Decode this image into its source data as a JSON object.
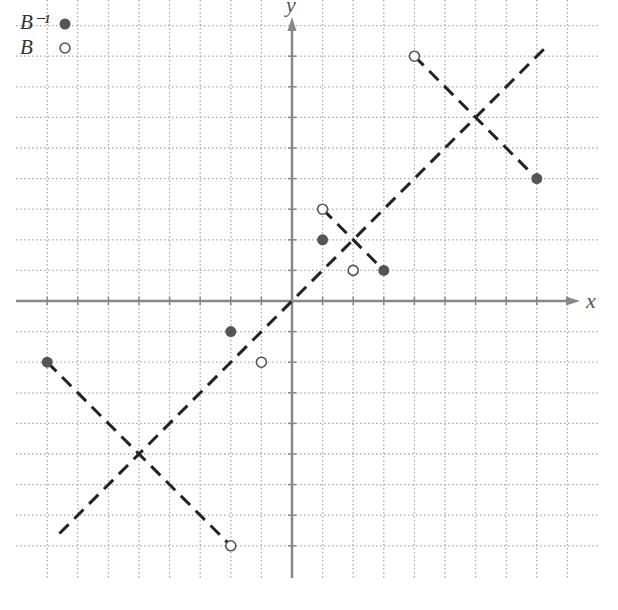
{
  "chart_data": {
    "type": "scatter",
    "title": "",
    "xlabel": "x",
    "ylabel": "y",
    "xlim": [
      -9,
      9
    ],
    "ylim": [
      -9,
      9
    ],
    "grid": true,
    "grid_style": "dotted",
    "legend": [
      {
        "label": "B⁻¹",
        "marker": "filled-circle"
      },
      {
        "label": "B",
        "marker": "open-circle"
      }
    ],
    "legend_position": "top-left",
    "series": [
      {
        "name": "B⁻¹",
        "marker": "filled-circle",
        "points": [
          [
            1,
            2
          ],
          [
            3,
            1
          ],
          [
            8,
            4
          ],
          [
            -2,
            -1
          ],
          [
            -8,
            -2
          ]
        ]
      },
      {
        "name": "B",
        "marker": "open-circle",
        "points": [
          [
            1,
            3
          ],
          [
            2,
            1
          ],
          [
            4,
            8
          ],
          [
            -1,
            -2
          ],
          [
            -2,
            -8
          ]
        ]
      }
    ],
    "lines": [
      {
        "name": "y = x",
        "style": "dashed",
        "from": [
          -7.6,
          -7.6
        ],
        "to": [
          8.4,
          8.4
        ]
      },
      {
        "name": "reflection-segment-1",
        "style": "dashed",
        "from": [
          1,
          3
        ],
        "to": [
          3,
          1
        ]
      },
      {
        "name": "reflection-segment-2",
        "style": "dashed",
        "from": [
          4,
          8
        ],
        "to": [
          8,
          4
        ]
      },
      {
        "name": "reflection-segment-3",
        "style": "dashed",
        "from": [
          -8,
          -2
        ],
        "to": [
          -2,
          -8
        ]
      }
    ]
  },
  "legend": {
    "inverse_label": "B⁻¹",
    "original_label": "B"
  },
  "axes": {
    "x_label": "x",
    "y_label": "y"
  },
  "colors": {
    "filled_marker": "#555555",
    "open_marker_stroke": "#555555",
    "dashed_line": "#222222",
    "axis": "#888888",
    "grid": "#aaaaaa"
  }
}
